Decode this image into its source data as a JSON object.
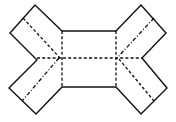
{
  "diagram": {
    "type": "folding-net",
    "colors": {
      "line": "#111111",
      "background": "#ffffff"
    },
    "outline_points": [
      [
        62,
        31
      ],
      [
        35,
        5
      ],
      [
        10,
        33
      ],
      [
        37,
        60
      ],
      [
        9,
        88
      ],
      [
        36,
        114
      ],
      [
        62,
        87
      ],
      [
        116,
        87
      ],
      [
        141,
        114
      ],
      [
        167,
        88
      ],
      [
        142,
        58
      ],
      [
        166,
        33
      ],
      [
        141,
        5
      ],
      [
        116,
        31
      ]
    ],
    "central_rect": {
      "x1": 62,
      "y1": 31,
      "x2": 116,
      "y2": 87
    },
    "fold_lines": {
      "center_horizontal": [
        [
          37,
          58
        ],
        [
          142,
          58
        ]
      ],
      "center_left_vertical": [
        [
          62,
          31
        ],
        [
          62,
          87
        ]
      ],
      "center_right_vertical": [
        [
          116,
          31
        ],
        [
          116,
          87
        ]
      ],
      "flap_top_left": [
        [
          23,
          18
        ],
        [
          60,
          58
        ]
      ],
      "flap_bottom_left": [
        [
          59,
          58
        ],
        [
          22,
          101
        ]
      ],
      "flap_top_right": [
        [
          154,
          18
        ],
        [
          117,
          58
        ]
      ],
      "flap_bottom_right": [
        [
          119,
          59
        ],
        [
          154,
          101
        ]
      ]
    }
  }
}
